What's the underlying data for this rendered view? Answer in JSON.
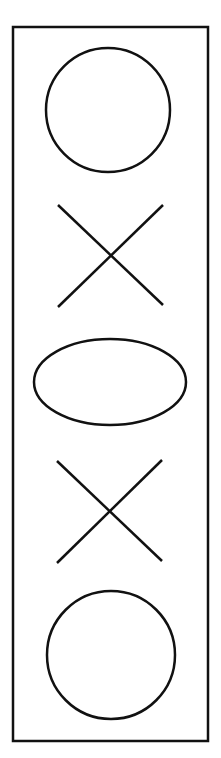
{
  "diagram": {
    "stroke_color": "#111111",
    "background_color": "#ffffff",
    "frame": {
      "x": 13,
      "y": 27,
      "width": 195,
      "height": 714
    },
    "shapes": [
      {
        "type": "circle",
        "cx": 108,
        "cy": 110,
        "r": 62
      },
      {
        "type": "x",
        "x1": 58,
        "y1": 205,
        "x2": 163,
        "y2": 305
      },
      {
        "type": "ellipse",
        "cx": 110,
        "cy": 382,
        "rx": 76,
        "ry": 43
      },
      {
        "type": "x",
        "x1": 57,
        "y1": 461,
        "x2": 162,
        "y2": 561
      },
      {
        "type": "circle",
        "cx": 111,
        "cy": 655,
        "r": 64
      }
    ]
  }
}
